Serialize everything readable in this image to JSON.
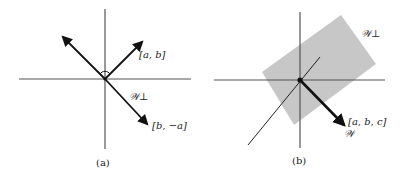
{
  "figure": {
    "panel_a": {
      "caption": "(a)",
      "vector_labels": {
        "v1": "[a, b]",
        "v2": "[b, −a]",
        "subspace": "𝒲⊥"
      },
      "notes": "Perpendicular vectors [a, b] and [b, −a] in the plane; right-angle mark at origin."
    },
    "panel_b": {
      "caption": "(b)",
      "vector_labels": {
        "v": "[a, b, c]",
        "line": "𝒲",
        "plane": "𝒲⊥"
      },
      "notes": "Vector [a, b, c] spans line W; shaded plane W⊥ is its orthogonal complement in 3D."
    },
    "colors": {
      "axis": "#555555",
      "vector": "#111111",
      "plane_fill": "#bdbdbd"
    }
  }
}
